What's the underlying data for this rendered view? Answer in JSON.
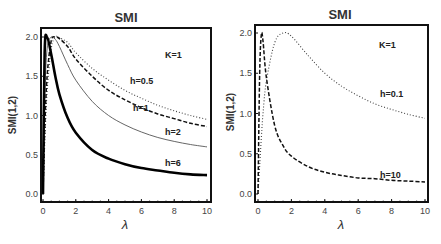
{
  "chart_data": [
    {
      "type": "line",
      "title": "SMI",
      "xlabel": "λ",
      "ylabel": "SMI(1,2)",
      "xlim": [
        0,
        10
      ],
      "ylim": [
        0,
        2.0
      ],
      "xticks": [
        "0",
        "2",
        "4",
        "6",
        "8",
        "10"
      ],
      "yticks": [
        "0.0",
        "0.5",
        "1.0",
        "1.5",
        "2.0"
      ],
      "annotation": "K=1",
      "x": [
        0,
        0.1,
        0.25,
        0.5,
        0.75,
        1,
        1.5,
        2,
        3,
        4,
        5,
        6,
        7,
        8,
        9,
        10
      ],
      "series": [
        {
          "name": "h=0.5",
          "style": "dotted",
          "values": [
            0,
            0.6,
            1.3,
            1.85,
            2.0,
            1.99,
            1.93,
            1.8,
            1.6,
            1.45,
            1.32,
            1.22,
            1.13,
            1.06,
            1.0,
            0.95
          ]
        },
        {
          "name": "h=1",
          "style": "dashed",
          "values": [
            0,
            0.8,
            1.5,
            1.95,
            2.0,
            1.98,
            1.88,
            1.72,
            1.5,
            1.32,
            1.2,
            1.1,
            1.02,
            0.96,
            0.9,
            0.86
          ]
        },
        {
          "name": "h=2",
          "style": "thin-solid",
          "values": [
            0,
            1.2,
            1.85,
            2.0,
            1.97,
            1.88,
            1.65,
            1.45,
            1.18,
            1.0,
            0.88,
            0.79,
            0.72,
            0.67,
            0.63,
            0.6
          ]
        },
        {
          "name": "h=6",
          "style": "thick-solid",
          "values": [
            0,
            1.8,
            2.0,
            1.78,
            1.5,
            1.27,
            0.97,
            0.78,
            0.56,
            0.45,
            0.38,
            0.33,
            0.3,
            0.27,
            0.25,
            0.24
          ]
        }
      ],
      "labels": {
        "h05": "h=0.5",
        "h1": "h=1",
        "h2": "h=2",
        "h6": "h=6"
      }
    },
    {
      "type": "line",
      "title": "SMI",
      "xlabel": "λ",
      "ylabel": "SMI(1,2)",
      "xlim": [
        0,
        10
      ],
      "ylim": [
        0,
        2.0
      ],
      "xticks": [
        "0",
        "2",
        "4",
        "6",
        "8",
        "10"
      ],
      "yticks": [
        "0.0",
        "0.5",
        "1.0",
        "1.5",
        "2.0"
      ],
      "annotation": "K=1",
      "x": [
        0,
        0.1,
        0.2,
        0.3,
        0.5,
        1,
        1.5,
        2,
        3,
        4,
        5,
        6,
        7,
        8,
        9,
        10
      ],
      "series": [
        {
          "name": "h=0.1",
          "style": "dotted",
          "values": [
            0,
            0.35,
            0.7,
            1.0,
            1.4,
            1.88,
            2.0,
            1.96,
            1.72,
            1.5,
            1.34,
            1.22,
            1.12,
            1.05,
            0.99,
            0.94
          ]
        },
        {
          "name": "h=10",
          "style": "dashed",
          "values": [
            0,
            1.5,
            1.98,
            1.9,
            1.45,
            0.85,
            0.6,
            0.47,
            0.34,
            0.27,
            0.23,
            0.2,
            0.19,
            0.17,
            0.16,
            0.15
          ]
        }
      ],
      "labels": {
        "h01": "h=0.1",
        "h10": "h=10"
      }
    }
  ]
}
